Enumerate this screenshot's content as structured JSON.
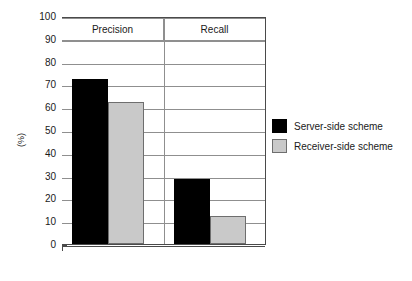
{
  "chart_data": {
    "type": "bar",
    "title": "",
    "xlabel": "",
    "ylabel": "(%)",
    "ylim": [
      0,
      100
    ],
    "ytick_step": 10,
    "yticks": [
      100,
      90,
      80,
      70,
      60,
      50,
      40,
      30,
      20,
      10,
      0
    ],
    "grid": true,
    "legend_position": "right",
    "categories": [
      "Precision",
      "Recall"
    ],
    "series": [
      {
        "name": "Server-side scheme",
        "color": "#000000",
        "values": [
          72.5,
          28.5
        ]
      },
      {
        "name": "Receiver-side scheme",
        "color": "#c9c9c9",
        "values": [
          62.5,
          12.5
        ]
      }
    ]
  },
  "axis": {
    "ylabel": "(%)",
    "tick_labels": [
      "100",
      "90",
      "80",
      "70",
      "60",
      "50",
      "40",
      "30",
      "20",
      "10",
      "0"
    ]
  },
  "groups": [
    {
      "label": "Precision"
    },
    {
      "label": "Recall"
    }
  ],
  "legend": {
    "items": [
      {
        "label": "Server-side scheme",
        "swatch": "dark"
      },
      {
        "label": "Receiver-side scheme",
        "swatch": "light"
      }
    ]
  }
}
